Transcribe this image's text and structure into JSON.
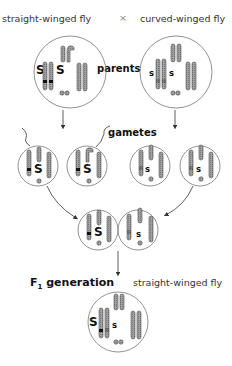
{
  "header": {
    "left_parent": "straight-winged fly",
    "cross_symbol": "×",
    "right_parent": "curved-winged fly"
  },
  "labels": {
    "parents": "parents",
    "gametes": "gametes",
    "f1_prefix": "F",
    "f1_subscript": "1",
    "f1_suffix": " generation",
    "f1_phenotype": "straight-winged fly"
  },
  "alleles": {
    "dominant": "S",
    "recessive": "s"
  },
  "colors": {
    "chromosome_fill": "#9a9a9a",
    "chromosome_stroke": "#555555",
    "cell_stroke": "#777777",
    "arrow": "#333333"
  }
}
